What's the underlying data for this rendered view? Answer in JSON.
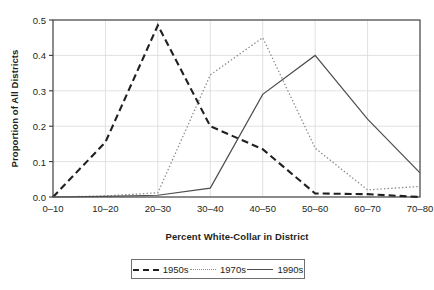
{
  "chart_data": {
    "type": "line",
    "title": "",
    "xlabel": "Percent White-Collar in District",
    "ylabel": "Proportion of All Districts",
    "categories": [
      "0–10",
      "10–20",
      "20–30",
      "30–40",
      "40–50",
      "50–60",
      "60–70",
      "70–80"
    ],
    "ylim": [
      0.0,
      0.5
    ],
    "yticks": [
      "0.0",
      "0.1",
      "0.2",
      "0.3",
      "0.4",
      "0.5"
    ],
    "ytick_values": [
      0.0,
      0.1,
      0.2,
      0.3,
      0.4,
      0.5
    ],
    "grid": true,
    "legend_position": "bottom",
    "series": [
      {
        "name": "1950s",
        "style": "dashed",
        "color": "#231f20",
        "values": [
          0.0,
          0.155,
          0.485,
          0.2,
          0.135,
          0.01,
          0.008,
          0.0
        ]
      },
      {
        "name": "1970s",
        "style": "dotted",
        "color": "#8a8a8a",
        "values": [
          0.0,
          0.003,
          0.012,
          0.345,
          0.45,
          0.138,
          0.02,
          0.03
        ]
      },
      {
        "name": "1990s",
        "style": "solid",
        "color": "#4d4d4d",
        "values": [
          0.0,
          0.002,
          0.005,
          0.025,
          0.29,
          0.4,
          0.22,
          0.068
        ]
      }
    ]
  },
  "legend": {
    "items": [
      {
        "label": "1950s"
      },
      {
        "label": "1970s"
      },
      {
        "label": "1990s"
      }
    ]
  }
}
